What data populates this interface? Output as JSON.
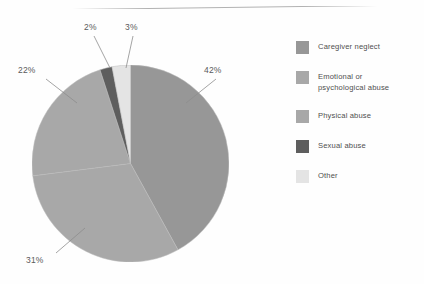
{
  "chart_data": {
    "type": "pie",
    "title": "",
    "subtitle": "",
    "xlabel": "",
    "ylabel": "",
    "unit": "%",
    "legend_position": "right",
    "grid": false,
    "start_angle_deg": 0,
    "direction": "clockwise",
    "categories": [
      "Caregiver neglect",
      "Physical abuse",
      "Emotional or psychological abuse",
      "Sexual abuse",
      "Other"
    ],
    "values": [
      42,
      31,
      22,
      2,
      3
    ],
    "labels": [
      "42%",
      "31%",
      "22%",
      "2%",
      "3%"
    ],
    "colors": [
      "#979797",
      "#a8a8a8",
      "#a8a8a8",
      "#5e5e5e",
      "#e4e4e4"
    ],
    "slices": [
      {
        "name": "Caregiver neglect",
        "value": 42,
        "label": "42%",
        "color": "#979797"
      },
      {
        "name": "Physical abuse",
        "value": 31,
        "label": "31%",
        "color": "#a8a8a8"
      },
      {
        "name": "Emotional or psychological abuse",
        "value": 22,
        "label": "22%",
        "color": "#a8a8a8"
      },
      {
        "name": "Sexual abuse",
        "value": 2,
        "label": "2%",
        "color": "#5e5e5e"
      },
      {
        "name": "Other",
        "value": 3,
        "label": "3%",
        "color": "#e4e4e4"
      }
    ]
  },
  "pie": {
    "label_42": "42%",
    "label_31": "31%",
    "label_22": "22%",
    "label_2": "2%",
    "label_3": "3%"
  },
  "legend": {
    "items": [
      {
        "label": "Caregiver neglect",
        "line1": "Caregiver neglect",
        "line2": "",
        "color": "#979797"
      },
      {
        "label": "Emotional or psychological abuse",
        "line1": "Emotional or",
        "line2": "psychological abuse",
        "color": "#a8a8a8"
      },
      {
        "label": "Physical abuse",
        "line1": "Physical abuse",
        "line2": "",
        "color": "#a8a8a8"
      },
      {
        "label": "Sexual abuse",
        "line1": "Sexual abuse",
        "line2": "",
        "color": "#5e5e5e"
      },
      {
        "label": "Other",
        "line1": "Other",
        "line2": "",
        "color": "#e4e4e4"
      }
    ]
  },
  "colors": {
    "caregiver_neglect": "#979797",
    "emotional_abuse": "#a8a8a8",
    "physical_abuse": "#a8a8a8",
    "sexual_abuse": "#5e5e5e",
    "other": "#e4e4e4",
    "text": "#4f4f4f",
    "leader_line": "#8d8d8d",
    "rule": "#b2b2b2",
    "background": "#fefefe"
  }
}
